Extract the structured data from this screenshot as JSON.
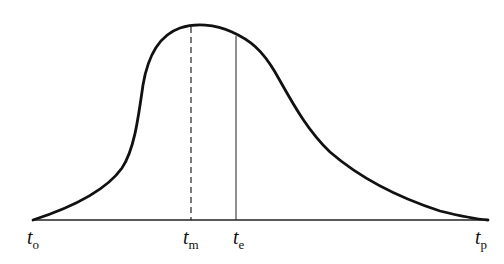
{
  "diagram": {
    "type": "hydrograph-curve",
    "labels": {
      "t_o": {
        "base": "t",
        "sub": "o"
      },
      "t_m": {
        "base": "t",
        "sub": "m"
      },
      "t_e": {
        "base": "t",
        "sub": "e"
      },
      "t_p": {
        "base": "t",
        "sub": "p"
      }
    },
    "markers": [
      {
        "name": "t_m",
        "style": "dashed"
      },
      {
        "name": "t_e",
        "style": "solid"
      }
    ],
    "colors": {
      "curve": "#111111",
      "axis": "#222222"
    }
  }
}
